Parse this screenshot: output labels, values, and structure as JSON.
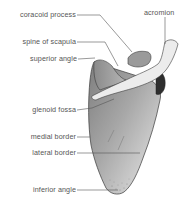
{
  "diagram": {
    "subject": "scapula",
    "colors": {
      "bone_fill_light": "#e6e6e6",
      "bone_fill_dark": "#8c8c8c",
      "spine_fill": "#eeeeee",
      "outline": "#3a3a3a",
      "leader_line": "#555555",
      "label_text": "#555555"
    },
    "labels": [
      {
        "id": "coracoid-process",
        "text": "coracoid process"
      },
      {
        "id": "acromion",
        "text": "acromion"
      },
      {
        "id": "spine-of-scapula",
        "text": "spine of scapula"
      },
      {
        "id": "superior-angle",
        "text": "superior angle"
      },
      {
        "id": "glenoid-fossa",
        "text": "glenoid fossa"
      },
      {
        "id": "medial-border",
        "text": "medial border"
      },
      {
        "id": "lateral-border",
        "text": "lateral border"
      },
      {
        "id": "inferior-angle",
        "text": "inferior angle"
      }
    ]
  }
}
